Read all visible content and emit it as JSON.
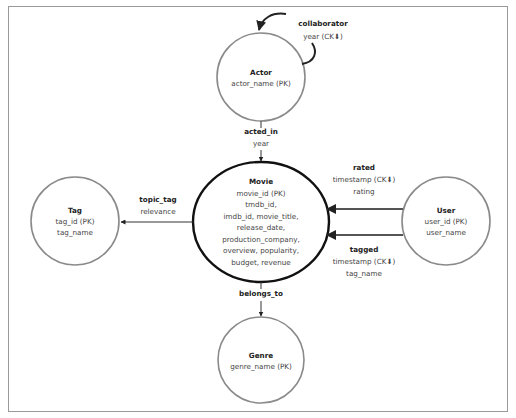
{
  "entities": {
    "actor": {
      "name": "Actor",
      "attributes": [
        "actor_name (PK)"
      ]
    },
    "movie": {
      "name": "Movie",
      "attributes": [
        "movie_id (PK)",
        "tmdb_id,",
        "imdb_id, movie_title,",
        "release_date,",
        "production_company,",
        "overview, popularity,",
        "budget, revenue"
      ]
    },
    "tag": {
      "name": "Tag",
      "attributes": [
        "tag_id (PK)",
        "tag_name"
      ]
    },
    "user": {
      "name": "User",
      "attributes": [
        "user_id (PK)",
        "user_name"
      ]
    },
    "genre": {
      "name": "Genre",
      "attributes": [
        "genre_name (PK)"
      ]
    }
  },
  "relationships": {
    "collaborator": {
      "name": "collaborator",
      "attributes": [
        "year (CK⬇)"
      ]
    },
    "acted_in": {
      "name": "acted_in",
      "attributes": [
        "year"
      ]
    },
    "topic_tag": {
      "name": "topic_tag",
      "attributes": [
        "relevance"
      ]
    },
    "rated": {
      "name": "rated",
      "attributes": [
        "timestamp (CK⬇)",
        "rating"
      ]
    },
    "tagged": {
      "name": "tagged",
      "attributes": [
        "timestamp (CK⬇)",
        "tag_name"
      ]
    },
    "belongs_to": {
      "name": "belongs_to",
      "attributes": []
    }
  },
  "colors": {
    "entity_stroke": "#8a8a8a",
    "central_entity_stroke": "#111111",
    "edge": "#333333",
    "frame": "#9a9a9a"
  }
}
